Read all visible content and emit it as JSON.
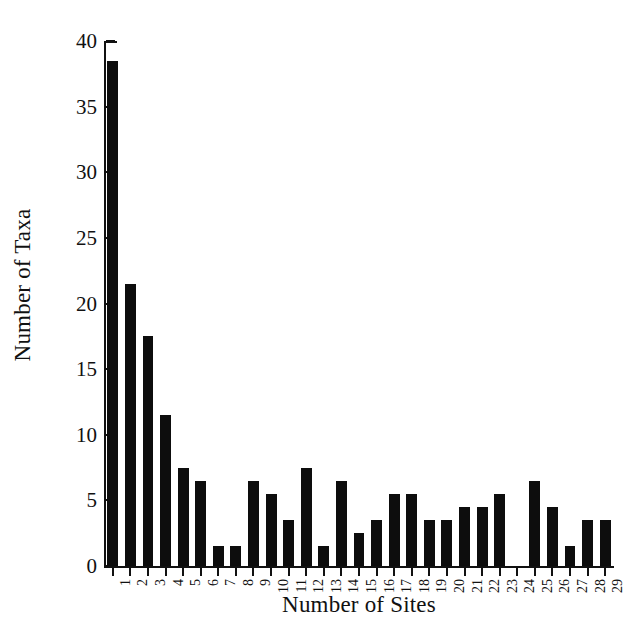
{
  "chart_data": {
    "type": "bar",
    "title": "",
    "xlabel": "Number of Sites",
    "ylabel": "Number of Taxa",
    "categories": [
      "1",
      "2",
      "3",
      "4",
      "5",
      "6",
      "7",
      "8",
      "9",
      "10",
      "11",
      "12",
      "13",
      "14",
      "15",
      "16",
      "17",
      "18",
      "19",
      "20",
      "21",
      "22",
      "23",
      "24",
      "25",
      "26",
      "27",
      "28",
      "29"
    ],
    "values": [
      38,
      21,
      17,
      11,
      7,
      6,
      1,
      1,
      6,
      5,
      3,
      7,
      1,
      6,
      2,
      3,
      5,
      5,
      3,
      3,
      4,
      4,
      5,
      0,
      6,
      4,
      1,
      3,
      3
    ],
    "values_estimated": [
      38.5,
      21.5,
      17.5,
      11.5,
      7.5,
      6.5,
      1.5,
      1.5,
      6.5,
      5.5,
      3.5,
      7.5,
      1.5,
      6.5,
      2.5,
      3.5,
      5.5,
      5.5,
      3.5,
      3.5,
      4.5,
      4.5,
      5.5,
      0,
      6.5,
      4.5,
      1.5,
      3.5,
      3.5
    ],
    "yticks": [
      0,
      5,
      10,
      15,
      20,
      25,
      30,
      35,
      40
    ],
    "ytick_labels": [
      "0",
      "5",
      "10",
      "15",
      "20",
      "25",
      "30",
      "35",
      "40"
    ],
    "ylim": [
      0,
      40
    ],
    "grid": false,
    "legend": null,
    "bar_color": "#0d0d0d",
    "axis_color": "#111111",
    "background": "#ffffff",
    "xtick_rotation": -90
  }
}
